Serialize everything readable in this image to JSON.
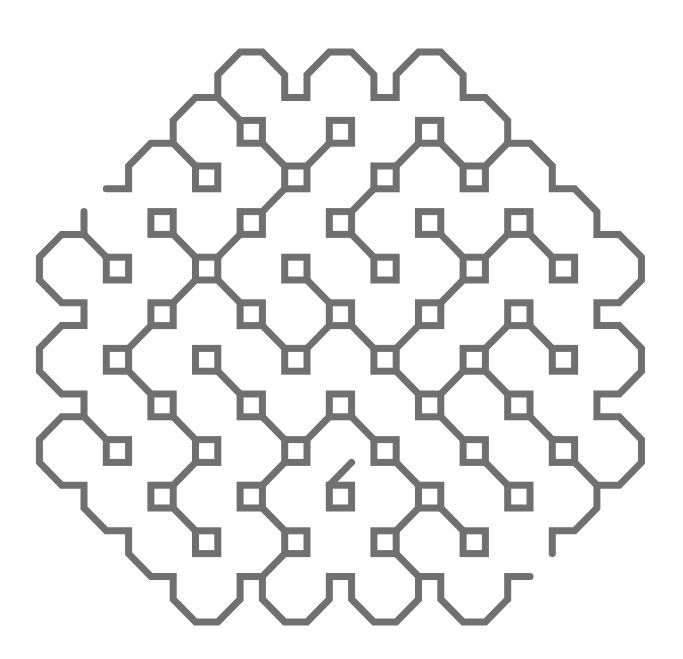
{
  "figure": {
    "title": "",
    "stroke_color": "#707070",
    "background": "#ffffff",
    "stroke_width": 7,
    "grid": {
      "origin_x": 84,
      "origin_y": 52,
      "step_x": 22.3,
      "step_y": 22.8
    },
    "boundary_paths": [
      [
        [
          1,
          6
        ],
        [
          2,
          6
        ],
        [
          2,
          5
        ],
        [
          3,
          4
        ],
        [
          4,
          4
        ],
        [
          4,
          3
        ],
        [
          5,
          2
        ],
        [
          6,
          2
        ],
        [
          6,
          1
        ],
        [
          7,
          0
        ],
        [
          8,
          0
        ],
        [
          9,
          1
        ],
        [
          9,
          2
        ],
        [
          10,
          2
        ],
        [
          10,
          1
        ],
        [
          11,
          0
        ],
        [
          12,
          0
        ],
        [
          13,
          1
        ],
        [
          13,
          2
        ],
        [
          14,
          2
        ],
        [
          14,
          1
        ],
        [
          15,
          0
        ],
        [
          16,
          0
        ],
        [
          17,
          1
        ],
        [
          17,
          2
        ],
        [
          18,
          2
        ],
        [
          19,
          3
        ],
        [
          19,
          4
        ],
        [
          20,
          4
        ],
        [
          21,
          5
        ],
        [
          21,
          6
        ],
        [
          22,
          6
        ],
        [
          23,
          7
        ],
        [
          23,
          8
        ],
        [
          24,
          8
        ],
        [
          25,
          9
        ],
        [
          25,
          10
        ],
        [
          24,
          11
        ],
        [
          23,
          11
        ],
        [
          23,
          12
        ],
        [
          24,
          12
        ],
        [
          25,
          13
        ],
        [
          25,
          14
        ],
        [
          24,
          15
        ],
        [
          23,
          15
        ],
        [
          23,
          16
        ],
        [
          24,
          16
        ],
        [
          25,
          17
        ],
        [
          25,
          18
        ],
        [
          24,
          19
        ],
        [
          23,
          19
        ],
        [
          23,
          20
        ],
        [
          22,
          21
        ],
        [
          21,
          21
        ],
        [
          21,
          22
        ]
      ],
      [
        [
          0,
          7
        ],
        [
          0,
          8
        ],
        [
          -1,
          8
        ],
        [
          -2,
          9
        ],
        [
          -2,
          10
        ],
        [
          -1,
          11
        ],
        [
          0,
          11
        ],
        [
          0,
          12
        ],
        [
          -1,
          12
        ],
        [
          -2,
          13
        ],
        [
          -2,
          14
        ],
        [
          -1,
          15
        ],
        [
          0,
          15
        ],
        [
          0,
          16
        ],
        [
          -1,
          16
        ],
        [
          -2,
          17
        ],
        [
          -2,
          18
        ],
        [
          -1,
          19
        ],
        [
          0,
          19
        ],
        [
          0,
          20
        ],
        [
          1,
          21
        ],
        [
          2,
          21
        ],
        [
          2,
          22
        ],
        [
          3,
          23
        ],
        [
          4,
          23
        ],
        [
          4,
          24
        ],
        [
          5,
          25
        ],
        [
          6,
          25
        ],
        [
          7,
          24
        ],
        [
          7,
          23
        ],
        [
          8,
          23
        ],
        [
          8,
          24
        ],
        [
          9,
          25
        ],
        [
          10,
          25
        ],
        [
          11,
          24
        ],
        [
          11,
          23
        ],
        [
          12,
          23
        ],
        [
          12,
          24
        ],
        [
          13,
          25
        ],
        [
          14,
          25
        ],
        [
          15,
          24
        ],
        [
          15,
          23
        ],
        [
          16,
          23
        ],
        [
          16,
          24
        ],
        [
          17,
          25
        ],
        [
          18,
          25
        ],
        [
          19,
          24
        ],
        [
          19,
          23
        ],
        [
          20,
          23
        ]
      ]
    ],
    "squares": [
      [
        7,
        3
      ],
      [
        11,
        3
      ],
      [
        15,
        3
      ],
      [
        5,
        5
      ],
      [
        9,
        5
      ],
      [
        13,
        5
      ],
      [
        17,
        5
      ],
      [
        3,
        7
      ],
      [
        7,
        7
      ],
      [
        11,
        7
      ],
      [
        15,
        7
      ],
      [
        19,
        7
      ],
      [
        1,
        9
      ],
      [
        5,
        9
      ],
      [
        9,
        9
      ],
      [
        13,
        9
      ],
      [
        17,
        9
      ],
      [
        21,
        9
      ],
      [
        3,
        11
      ],
      [
        7,
        11
      ],
      [
        11,
        11
      ],
      [
        15,
        11
      ],
      [
        19,
        11
      ],
      [
        1,
        13
      ],
      [
        5,
        13
      ],
      [
        9,
        13
      ],
      [
        13,
        13
      ],
      [
        17,
        13
      ],
      [
        21,
        13
      ],
      [
        3,
        15
      ],
      [
        7,
        15
      ],
      [
        11,
        15
      ],
      [
        15,
        15
      ],
      [
        19,
        15
      ],
      [
        1,
        17
      ],
      [
        5,
        17
      ],
      [
        9,
        17
      ],
      [
        13,
        17
      ],
      [
        17,
        17
      ],
      [
        21,
        17
      ],
      [
        3,
        19
      ],
      [
        7,
        19
      ],
      [
        11,
        19
      ],
      [
        15,
        19
      ],
      [
        19,
        19
      ],
      [
        5,
        21
      ],
      [
        9,
        21
      ],
      [
        13,
        21
      ],
      [
        17,
        21
      ]
    ],
    "connectors": [
      [
        [
          4,
          4
        ],
        [
          5,
          5
        ]
      ],
      [
        [
          6,
          2
        ],
        [
          7,
          3
        ]
      ],
      [
        [
          8,
          4
        ],
        [
          9,
          5
        ]
      ],
      [
        [
          10,
          5
        ],
        [
          11,
          4
        ]
      ],
      [
        [
          9,
          6
        ],
        [
          8,
          7
        ]
      ],
      [
        [
          13,
          6
        ],
        [
          12,
          7
        ]
      ],
      [
        [
          14,
          5
        ],
        [
          15,
          4
        ]
      ],
      [
        [
          16,
          4
        ],
        [
          17,
          5
        ]
      ],
      [
        [
          18,
          5
        ],
        [
          19,
          4
        ]
      ],
      [
        [
          4,
          8
        ],
        [
          5,
          9
        ]
      ],
      [
        [
          7,
          8
        ],
        [
          6,
          9
        ]
      ],
      [
        [
          0,
          8
        ],
        [
          1,
          9
        ]
      ],
      [
        [
          4,
          11
        ],
        [
          5,
          10
        ]
      ],
      [
        [
          3,
          12
        ],
        [
          2,
          13
        ]
      ],
      [
        [
          2,
          14
        ],
        [
          3,
          15
        ]
      ],
      [
        [
          6,
          10
        ],
        [
          7,
          11
        ]
      ],
      [
        [
          8,
          12
        ],
        [
          9,
          13
        ]
      ],
      [
        [
          10,
          13
        ],
        [
          11,
          12
        ]
      ],
      [
        [
          10,
          10
        ],
        [
          11,
          11
        ]
      ],
      [
        [
          12,
          8
        ],
        [
          13,
          9
        ]
      ],
      [
        [
          12,
          12
        ],
        [
          13,
          13
        ]
      ],
      [
        [
          14,
          13
        ],
        [
          15,
          12
        ]
      ],
      [
        [
          14,
          14
        ],
        [
          15,
          15
        ]
      ],
      [
        [
          16,
          11
        ],
        [
          17,
          10
        ]
      ],
      [
        [
          16,
          8
        ],
        [
          17,
          9
        ]
      ],
      [
        [
          18,
          9
        ],
        [
          19,
          8
        ]
      ],
      [
        [
          20,
          8
        ],
        [
          21,
          9
        ]
      ],
      [
        [
          19,
          12
        ],
        [
          18,
          13
        ]
      ],
      [
        [
          20,
          12
        ],
        [
          21,
          13
        ]
      ],
      [
        [
          17,
          14
        ],
        [
          16,
          15
        ]
      ],
      [
        [
          18,
          14
        ],
        [
          19,
          15
        ]
      ],
      [
        [
          20,
          16
        ],
        [
          21,
          17
        ]
      ],
      [
        [
          22,
          18
        ],
        [
          23,
          19
        ]
      ],
      [
        [
          16,
          16
        ],
        [
          17,
          17
        ]
      ],
      [
        [
          18,
          18
        ],
        [
          19,
          19
        ]
      ],
      [
        [
          0,
          16
        ],
        [
          1,
          17
        ]
      ],
      [
        [
          4,
          16
        ],
        [
          5,
          17
        ]
      ],
      [
        [
          5,
          18
        ],
        [
          4,
          19
        ]
      ],
      [
        [
          4,
          20
        ],
        [
          5,
          21
        ]
      ],
      [
        [
          6,
          14
        ],
        [
          7,
          15
        ]
      ],
      [
        [
          8,
          16
        ],
        [
          9,
          17
        ]
      ],
      [
        [
          10,
          17
        ],
        [
          11,
          16
        ]
      ],
      [
        [
          9,
          18
        ],
        [
          8,
          19
        ]
      ],
      [
        [
          8,
          20
        ],
        [
          9,
          21
        ]
      ],
      [
        [
          9,
          22
        ],
        [
          8,
          23
        ]
      ],
      [
        [
          12,
          16
        ],
        [
          13,
          17
        ]
      ],
      [
        [
          12,
          18
        ],
        [
          11,
          19
        ]
      ],
      [
        [
          14,
          18
        ],
        [
          15,
          19
        ]
      ],
      [
        [
          15,
          20
        ],
        [
          14,
          21
        ]
      ],
      [
        [
          16,
          20
        ],
        [
          17,
          21
        ]
      ],
      [
        [
          14,
          22
        ],
        [
          15,
          23
        ]
      ]
    ]
  }
}
